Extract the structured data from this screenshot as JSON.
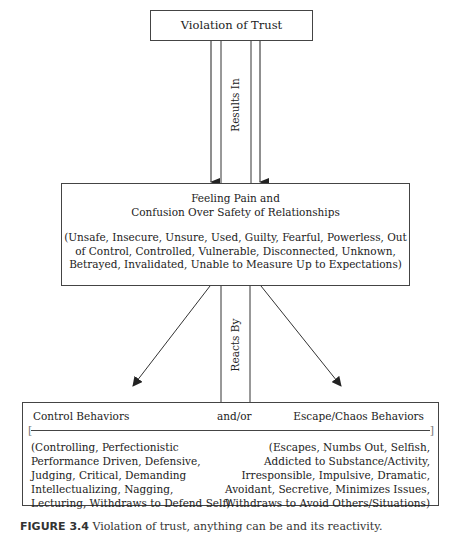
{
  "diagram": {
    "top_box": {
      "label": "Violation of Trust"
    },
    "connector_top": {
      "label": "Results In"
    },
    "middle_box": {
      "title_line1": "Feeling Pain and",
      "title_line2": "Confusion Over Safety of Relationships",
      "description": "(Unsafe, Insecure, Unsure, Used, Guilty, Fearful, Powerless, Out of Control, Controlled, Vulnerable, Disconnected, Unknown, Betrayed, Invalidated, Unable to Measure Up to Expectations)"
    },
    "connector_bottom": {
      "label": "Reacts By"
    },
    "bottom_box": {
      "left_heading": "Control Behaviors",
      "center_heading": "and/or",
      "right_heading": "Escape/Chaos Behaviors",
      "left_bracket": "[",
      "right_bracket": "]",
      "left_items": "(Controlling, Perfectionistic\nPerformance Driven, Defensive,\nJudging, Critical, Demanding\nIntellectualizing, Nagging,\nLecturing, Withdraws to Defend Self)",
      "right_items": "(Escapes, Numbs Out, Selfish,\nAddicted to Substance/Activity,\nIrresponsible, Impulsive, Dramatic,\nAvoidant, Secretive, Minimizes Issues,\nWithdraws to Avoid Others/Situations)"
    },
    "caption": {
      "figure_label": "FIGURE 3.4",
      "text": "Violation of trust, anything can be and its reactivity."
    }
  },
  "colors": {
    "line": "#444444",
    "text": "#222222",
    "background": "#ffffff"
  }
}
